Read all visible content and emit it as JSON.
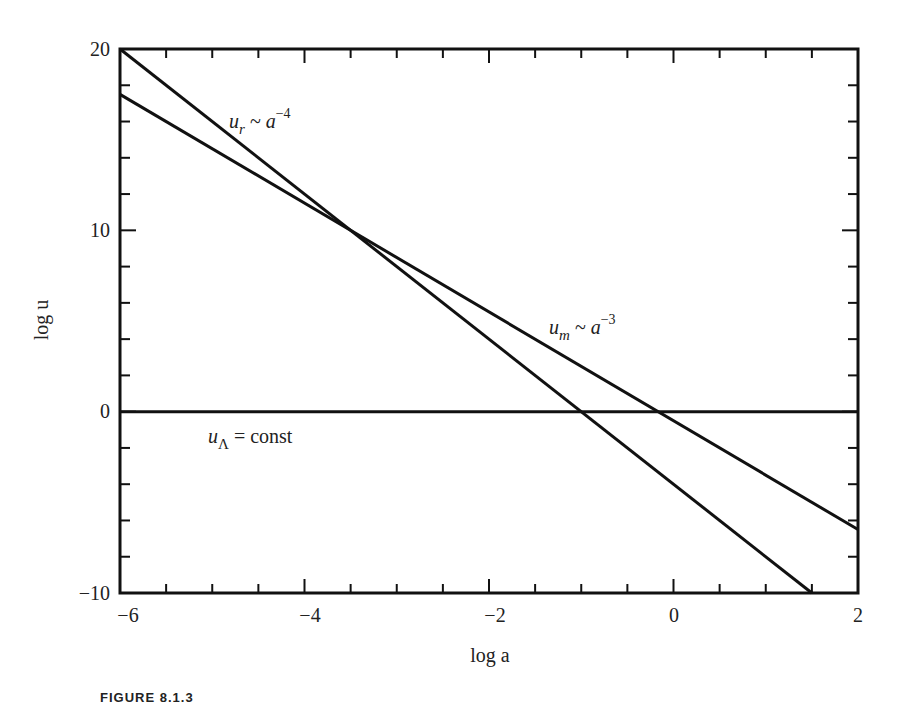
{
  "chart_data": {
    "type": "line",
    "title": "",
    "xlabel": "log a",
    "ylabel": "log u",
    "xlim": [
      -6,
      2
    ],
    "ylim": [
      -10,
      20
    ],
    "x_ticks": [
      -6,
      -4,
      -2,
      0,
      2
    ],
    "y_ticks": [
      -10,
      0,
      10,
      20
    ],
    "x_minor_step": 0.5,
    "y_minor_step": 2,
    "grid": false,
    "legend": "inline annotations",
    "series": [
      {
        "name": "u_r ~ a^-4",
        "label_main": "u",
        "label_sub": "r",
        "label_rest": " ~ a",
        "label_sup": "−4",
        "slope": -4,
        "x": [
          -6,
          1.5
        ],
        "y": [
          20,
          -10
        ]
      },
      {
        "name": "u_m ~ a^-3",
        "label_main": "u",
        "label_sub": "m",
        "label_rest": " ~ a",
        "label_sup": "−3",
        "slope": -3,
        "x": [
          -6,
          2
        ],
        "y": [
          17.5,
          -6.5
        ]
      },
      {
        "name": "u_Λ = const",
        "label_main": "u",
        "label_sub": "Λ",
        "label_rest": " = const",
        "label_sup": "",
        "slope": 0,
        "x": [
          -6,
          2
        ],
        "y": [
          0,
          0
        ]
      }
    ],
    "annotations": [
      {
        "text": "u_r ~ a^-4",
        "x": -4.2,
        "y": 15.5
      },
      {
        "text": "u_m ~ a^-3",
        "x": -1.4,
        "y": 3.3
      },
      {
        "text": "u_Λ = const",
        "x": -5.2,
        "y": -1.9
      }
    ],
    "intersections": [
      {
        "between": [
          "u_r",
          "u_m"
        ],
        "x": -3.5,
        "y": 10
      },
      {
        "between": [
          "u_r",
          "u_Λ"
        ],
        "x": -1,
        "y": 0
      },
      {
        "between": [
          "u_m",
          "u_Λ"
        ],
        "x": -0.17,
        "y": 0
      }
    ]
  },
  "labels": {
    "x_axis": "log a",
    "y_axis": "log u",
    "x_ticks": [
      "−6",
      "−4",
      "−2",
      "0",
      "2"
    ],
    "y_ticks": [
      "20",
      "10",
      "0",
      "−10"
    ],
    "caption": "FIGURE 8.1.3"
  }
}
